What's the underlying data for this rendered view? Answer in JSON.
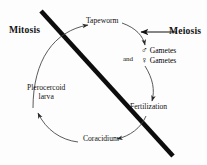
{
  "diagram": {
    "domains": [
      {
        "id": "mitosis",
        "label": "Mitosis"
      },
      {
        "id": "meiosis",
        "label": "Meiosis"
      }
    ],
    "nodes": [
      {
        "id": "tapeworm",
        "label": "Tapeworm"
      },
      {
        "id": "gametes_male",
        "label": "Gametes"
      },
      {
        "id": "gametes_female",
        "label": "Gametes"
      },
      {
        "id": "fertilization",
        "label": "Fertilization"
      },
      {
        "id": "coracidium",
        "label": "Coracidium"
      },
      {
        "id": "plerocercoid_line1",
        "label": "Plerocercoid"
      },
      {
        "id": "plerocercoid_line2",
        "label": "larva"
      }
    ],
    "connectors": {
      "and_label": "and",
      "male_symbol": "♂",
      "female_symbol": "♀"
    },
    "colors": {
      "ink": "#121212",
      "divider": "#0d0d0d",
      "arc": "#3a3a3a",
      "background": "#fdfdfd"
    }
  }
}
